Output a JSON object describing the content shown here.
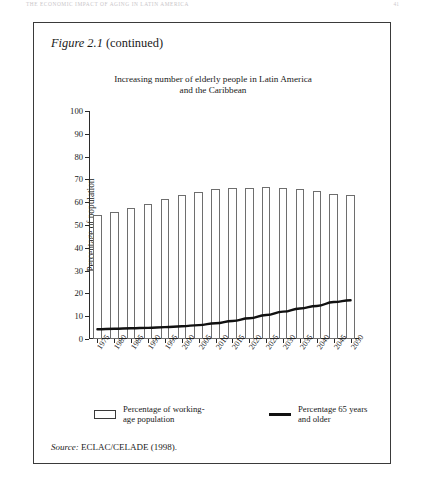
{
  "running_head": {
    "text": "THE ECONOMIC IMPACT OF AGING IN LATIN AMERICA",
    "page": "41"
  },
  "figure": {
    "label": "Figure 2.1",
    "continued": "(continued)"
  },
  "source": {
    "label": "Source:",
    "text": "ECLAC/CELADE (1998)."
  },
  "legend": {
    "items": [
      {
        "name": "working-age-population",
        "swatch": "bar-outline",
        "line1": "Percentage of working-",
        "line2": "age population"
      },
      {
        "name": "elderly-population",
        "swatch": "thick-line",
        "line1": "Percentage 65 years",
        "line2": "and older"
      }
    ]
  },
  "chart_data": {
    "type": "bar",
    "title": "Increasing number of elderly people in Latin America and the Caribbean",
    "title_line1": "Increasing number of elderly people in Latin America",
    "title_line2": "and the Caribbean",
    "xlabel": "",
    "ylabel": "Percentage of population",
    "ylim": [
      0,
      100
    ],
    "ytick_step": 10,
    "yticks": [
      0,
      10,
      20,
      30,
      40,
      50,
      60,
      70,
      80,
      90,
      100
    ],
    "grid": false,
    "legend_position": "bottom",
    "categories": [
      "1975",
      "1980",
      "1985",
      "1990",
      "1995",
      "2000",
      "2005",
      "2010",
      "2015",
      "2020",
      "2025",
      "2030",
      "2035",
      "2040",
      "2045",
      "2050"
    ],
    "series": [
      {
        "name": "Percentage of working-age population",
        "type": "bar",
        "color": "#ffffff",
        "edge_color": "#6e6e6e",
        "values": [
          54.2,
          55.8,
          57.3,
          59.2,
          61.2,
          63.0,
          64.6,
          65.7,
          66.4,
          66.4,
          66.5,
          66.2,
          65.8,
          64.7,
          63.8,
          63.0
        ]
      },
      {
        "name": "Percentage 65 years and older",
        "type": "line",
        "color": "#111111",
        "values": [
          4.3,
          4.5,
          4.7,
          4.9,
          5.2,
          5.6,
          6.1,
          6.9,
          7.9,
          9.1,
          10.5,
          12.0,
          13.4,
          14.5,
          16.2,
          17.0
        ]
      }
    ]
  }
}
